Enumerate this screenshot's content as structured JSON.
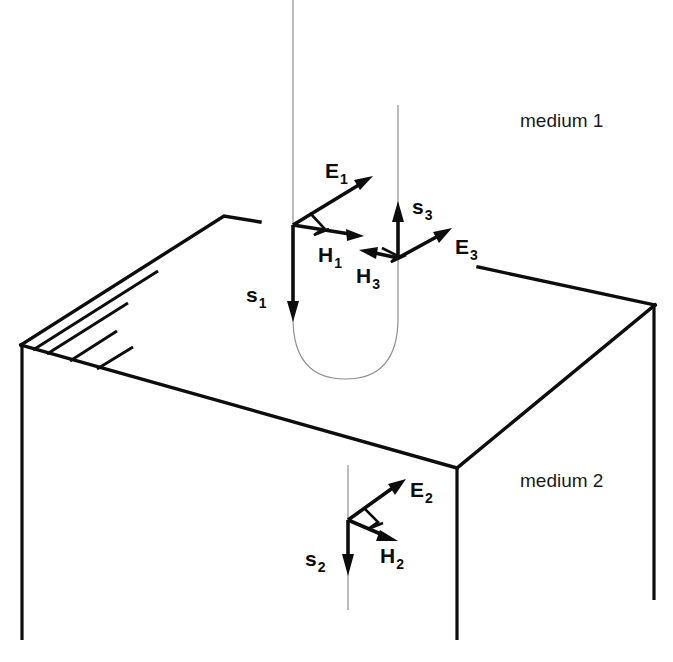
{
  "figure": {
    "background_color": "#ffffff",
    "ink_color": "#0d0d0d",
    "ray_color": "#8c8c8c"
  },
  "media": {
    "upper": {
      "label": "medium 1",
      "x": 520,
      "y": 127
    },
    "lower": {
      "label": "medium 2",
      "x": 520,
      "y": 487
    }
  },
  "vectors": {
    "incident": {
      "E": {
        "label": "E",
        "subscript": "1",
        "label_x": 325,
        "label_y": 178
      },
      "H": {
        "label": "H",
        "subscript": "1",
        "label_x": 318,
        "label_y": 262
      },
      "S": {
        "label": "s",
        "subscript": "1",
        "label_x": 246,
        "label_y": 302
      }
    },
    "reflected": {
      "E": {
        "label": "E",
        "subscript": "3",
        "label_x": 455,
        "label_y": 254
      },
      "H": {
        "label": "H",
        "subscript": "3",
        "label_x": 356,
        "label_y": 283
      },
      "S": {
        "label": "s",
        "subscript": "3",
        "label_x": 412,
        "label_y": 214
      }
    },
    "transmitted": {
      "E": {
        "label": "E",
        "subscript": "2",
        "label_x": 410,
        "label_y": 497
      },
      "H": {
        "label": "H",
        "subscript": "2",
        "label_x": 380,
        "label_y": 563
      },
      "S": {
        "label": "s",
        "subscript": "2",
        "label_x": 305,
        "label_y": 566
      }
    }
  },
  "geometry": {
    "slab_top_face": {
      "left_vertex": [
        21,
        345
      ],
      "back_apex": [
        224,
        216
      ],
      "back_break_right": [
        260,
        222
      ],
      "back_resume": [
        478,
        267
      ],
      "right_vertex": [
        655,
        305
      ],
      "front_vertex": [
        457,
        468
      ]
    },
    "slab_depth": 295,
    "incident_ray_x": 293,
    "reflected_ray_x": 398,
    "transmitted_ray_x": 348,
    "turn_curve_bottom_y": 370
  }
}
